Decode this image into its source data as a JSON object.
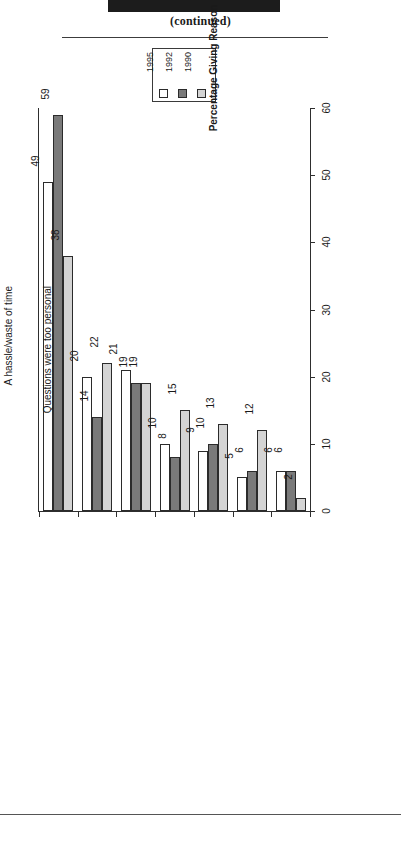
{
  "header": {
    "redacted_title": "",
    "continued_label": "(continued)"
  },
  "legend": {
    "entries": [
      {
        "label": "1995",
        "color": "#ffffff"
      },
      {
        "label": "1992",
        "color": "#7a7a7a"
      },
      {
        "label": "1990",
        "color": "#d4d4d4"
      }
    ]
  },
  "axes": {
    "category_title": "Reason",
    "value_title": "Percentage Giving Reason",
    "value_ticks": [
      "0",
      "10",
      "20",
      "30",
      "40",
      "50",
      "60"
    ]
  },
  "chart_data": {
    "type": "bar",
    "title": "(continued)",
    "xlabel": "Reason",
    "ylabel": "Percentage Giving Reason",
    "ylim": [
      0,
      60
    ],
    "yticks": [
      0,
      10,
      20,
      30,
      40,
      50,
      60
    ],
    "grid": false,
    "legend_position": "top-center",
    "orientation": "vertical-bars-rotated-page",
    "categories": [
      "No time/in hurry",
      "Inopportune time/timing inappropriate",
      "Not interested/does not apply to me",
      "Do not want to be bothered/invasion of privacy",
      "Believed it was a sales pitch",
      "A hassle/waste of time",
      "Questions were too personal"
    ],
    "series": [
      {
        "name": "1995",
        "color": "#ffffff",
        "values": [
          49,
          20,
          21,
          10,
          9,
          5,
          6
        ]
      },
      {
        "name": "1992",
        "color": "#7a7a7a",
        "values": [
          59,
          14,
          19,
          8,
          10,
          6,
          6
        ]
      },
      {
        "name": "1990",
        "color": "#d4d4d4",
        "values": [
          38,
          22,
          19,
          15,
          13,
          12,
          2
        ]
      }
    ]
  }
}
